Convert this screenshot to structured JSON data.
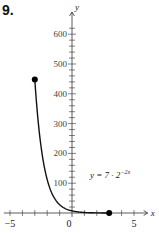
{
  "problem": {
    "number": "9."
  },
  "equation": {
    "lhs": "y = 7 · 2",
    "exponent": "−2x"
  },
  "axes": {
    "x_label": "x",
    "y_label": "y",
    "x_ticks": [
      "−5",
      "0",
      "5"
    ],
    "y_ticks": [
      "100",
      "200",
      "300",
      "400",
      "500",
      "600"
    ]
  },
  "chart_data": {
    "type": "line",
    "title": "",
    "function": "y = 7 · 2^(−2x)",
    "domain": [
      -3,
      3
    ],
    "xlabel": "x",
    "ylabel": "y",
    "xlim": [
      -5.5,
      6
    ],
    "ylim": [
      0,
      650
    ],
    "x_tick_labels": [
      -5,
      0,
      5
    ],
    "x_minor_step": 1,
    "y_tick_labels": [
      100,
      200,
      300,
      400,
      500,
      600
    ],
    "y_minor_step": 20,
    "grid": false,
    "endpoints": [
      {
        "x": -3,
        "y": 448,
        "closed": true
      },
      {
        "x": 3,
        "y": 0.109,
        "closed": true
      }
    ],
    "series": [
      {
        "name": "y = 7·2^(−2x)",
        "x": [
          -3,
          -2.5,
          -2,
          -1.5,
          -1,
          -0.5,
          0,
          0.5,
          1,
          1.5,
          2,
          2.5,
          3
        ],
        "values": [
          448,
          224,
          112,
          56,
          28,
          14,
          7,
          3.5,
          1.75,
          0.875,
          0.4375,
          0.219,
          0.109
        ]
      }
    ]
  }
}
